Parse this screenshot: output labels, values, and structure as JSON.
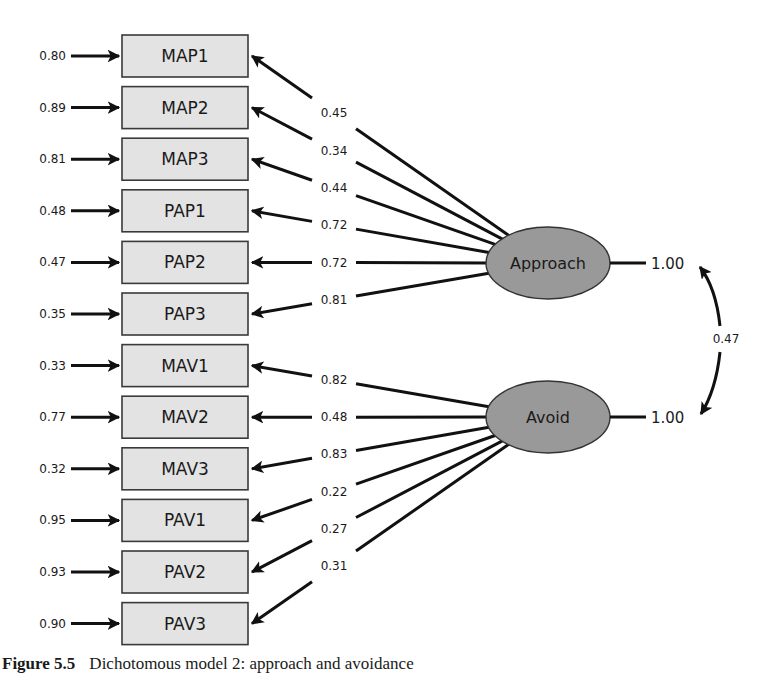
{
  "diagram": {
    "type": "confirmatory factor analysis path diagram",
    "factors": [
      {
        "name": "Approach",
        "variance": "1.00"
      },
      {
        "name": "Avoid",
        "variance": "1.00"
      }
    ],
    "factor_correlation": "0.47",
    "indicators": [
      {
        "name": "MAP1",
        "factor": "Approach",
        "loading": "0.45",
        "residual": "0.80"
      },
      {
        "name": "MAP2",
        "factor": "Approach",
        "loading": "0.34",
        "residual": "0.89"
      },
      {
        "name": "MAP3",
        "factor": "Approach",
        "loading": "0.44",
        "residual": "0.81"
      },
      {
        "name": "PAP1",
        "factor": "Approach",
        "loading": "0.72",
        "residual": "0.48"
      },
      {
        "name": "PAP2",
        "factor": "Approach",
        "loading": "0.72",
        "residual": "0.47"
      },
      {
        "name": "PAP3",
        "factor": "Approach",
        "loading": "0.81",
        "residual": "0.35"
      },
      {
        "name": "MAV1",
        "factor": "Avoid",
        "loading": "0.82",
        "residual": "0.33"
      },
      {
        "name": "MAV2",
        "factor": "Avoid",
        "loading": "0.48",
        "residual": "0.77"
      },
      {
        "name": "MAV3",
        "factor": "Avoid",
        "loading": "0.83",
        "residual": "0.32"
      },
      {
        "name": "PAV1",
        "factor": "Avoid",
        "loading": "0.22",
        "residual": "0.95"
      },
      {
        "name": "PAV2",
        "factor": "Avoid",
        "loading": "0.27",
        "residual": "0.93"
      },
      {
        "name": "PAV3",
        "factor": "Avoid",
        "loading": "0.31",
        "residual": "0.90"
      }
    ]
  },
  "caption": {
    "label": "Figure 5.5",
    "text": "Dichotomous model 2: approach and avoidance"
  },
  "colors": {
    "box_fill": "#e3e3e3",
    "factor_fill": "#999999",
    "ink": "#111111"
  }
}
